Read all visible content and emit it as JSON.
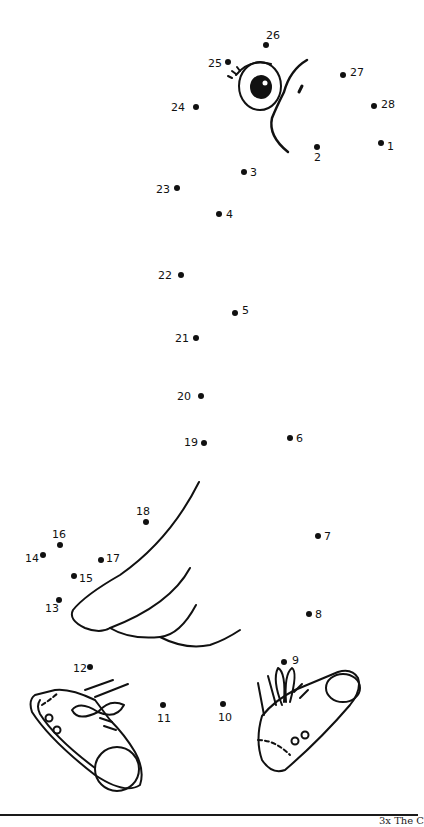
{
  "page": {
    "footer_text": "3x  The C"
  },
  "colors": {
    "ink": "#111111",
    "paper": "#ffffff"
  },
  "dots": [
    {
      "n": "1",
      "x": 381,
      "y": 143,
      "lx": 387,
      "ly": 141
    },
    {
      "n": "2",
      "x": 317,
      "y": 147,
      "lx": 314,
      "ly": 152
    },
    {
      "n": "3",
      "x": 244,
      "y": 172,
      "lx": 250,
      "ly": 167
    },
    {
      "n": "4",
      "x": 219,
      "y": 214,
      "lx": 226,
      "ly": 209
    },
    {
      "n": "5",
      "x": 235,
      "y": 313,
      "lx": 242,
      "ly": 305
    },
    {
      "n": "6",
      "x": 290,
      "y": 438,
      "lx": 296,
      "ly": 433
    },
    {
      "n": "7",
      "x": 318,
      "y": 536,
      "lx": 324,
      "ly": 531
    },
    {
      "n": "8",
      "x": 309,
      "y": 614,
      "lx": 315,
      "ly": 609
    },
    {
      "n": "9",
      "x": 284,
      "y": 662,
      "lx": 292,
      "ly": 655
    },
    {
      "n": "10",
      "x": 223,
      "y": 704,
      "lx": 218,
      "ly": 712
    },
    {
      "n": "11",
      "x": 163,
      "y": 705,
      "lx": 157,
      "ly": 713
    },
    {
      "n": "12",
      "x": 90,
      "y": 667,
      "lx": 73,
      "ly": 663
    },
    {
      "n": "13",
      "x": 59,
      "y": 600,
      "lx": 45,
      "ly": 603
    },
    {
      "n": "14",
      "x": 43,
      "y": 555,
      "lx": 25,
      "ly": 553
    },
    {
      "n": "15",
      "x": 74,
      "y": 576,
      "lx": 79,
      "ly": 573
    },
    {
      "n": "16",
      "x": 60,
      "y": 545,
      "lx": 52,
      "ly": 529
    },
    {
      "n": "17",
      "x": 101,
      "y": 560,
      "lx": 106,
      "ly": 553
    },
    {
      "n": "18",
      "x": 146,
      "y": 522,
      "lx": 136,
      "ly": 506
    },
    {
      "n": "19",
      "x": 204,
      "y": 443,
      "lx": 184,
      "ly": 437
    },
    {
      "n": "20",
      "x": 201,
      "y": 396,
      "lx": 177,
      "ly": 391
    },
    {
      "n": "21",
      "x": 196,
      "y": 338,
      "lx": 175,
      "ly": 333
    },
    {
      "n": "22",
      "x": 181,
      "y": 275,
      "lx": 158,
      "ly": 270
    },
    {
      "n": "23",
      "x": 177,
      "y": 188,
      "lx": 156,
      "ly": 184
    },
    {
      "n": "24",
      "x": 196,
      "y": 107,
      "lx": 171,
      "ly": 102
    },
    {
      "n": "25",
      "x": 228,
      "y": 62,
      "lx": 208,
      "ly": 58
    },
    {
      "n": "26",
      "x": 266,
      "y": 45,
      "lx": 266,
      "ly": 30
    },
    {
      "n": "27",
      "x": 343,
      "y": 75,
      "lx": 350,
      "ly": 67
    },
    {
      "n": "28",
      "x": 374,
      "y": 106,
      "lx": 381,
      "ly": 99
    }
  ]
}
